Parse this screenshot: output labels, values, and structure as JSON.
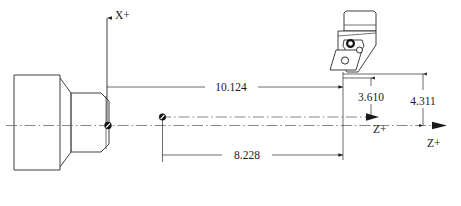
{
  "diagram": {
    "type": "engineering-drawing",
    "background_color": "#ffffff",
    "line_color": "#2b2b2b",
    "units": "inches"
  },
  "axes": {
    "x_positive": {
      "label": "X+",
      "direction": "up",
      "icon": "arrow-up-icon"
    },
    "z_positive_tool": {
      "label": "Z+",
      "direction": "right",
      "icon": "arrow-right-icon"
    },
    "z_positive_part": {
      "label": "Z+",
      "direction": "right",
      "icon": "arrow-right-icon"
    }
  },
  "dimensions": [
    {
      "id": "dim-10-124",
      "value": "10.124",
      "orientation": "horizontal",
      "placement": "upper",
      "description": "Z distance from part X+ datum plane to tool reference"
    },
    {
      "id": "dim-8-228",
      "value": "8.228",
      "orientation": "horizontal",
      "placement": "lower",
      "description": "Z distance from tool tip node to tool reference plane"
    },
    {
      "id": "dim-3-610",
      "value": "3.610",
      "orientation": "vertical",
      "placement": "right-inner",
      "description": "X offset from tool reference to upper Z+ axis"
    },
    {
      "id": "dim-4-311",
      "value": "4.311",
      "orientation": "vertical",
      "placement": "right-outer",
      "description": "X offset from tool reference to lower Z+ axis"
    }
  ],
  "parts": {
    "workpiece": {
      "name": "stepped-turned-workpiece",
      "description": "Stepped cylindrical part shown in half-section with chamfers"
    },
    "tool": {
      "name": "lathe-tool-holder",
      "description": "Turning tool holder with clamped insert and screw"
    }
  },
  "markers": [
    {
      "id": "node-part-datum",
      "name": "part-datum-node",
      "description": "Reference point on part face at centerline"
    },
    {
      "id": "node-tool-origin",
      "name": "tool-origin-node",
      "description": "Reference point on upper Z+ axis"
    }
  ]
}
